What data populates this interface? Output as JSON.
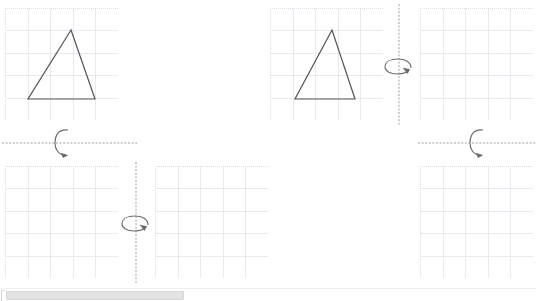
{
  "document": {
    "title": "Rotation Axis Worksheet",
    "background_color": "#ffffff",
    "width": 536,
    "height": 301
  },
  "style": {
    "grid_line_color": "#e9e9f2",
    "grid_border_color": "#dcdce8",
    "shape_stroke_color": "#555555",
    "axis_color": "#9aa0a6",
    "arrow_color": "#6b6b6b",
    "scrollbar_thumb_color": "#e3e3e3",
    "scrollbar_track_color": "#ffffff"
  },
  "panels": [
    {
      "id": "panel-top-left",
      "name": "grid-top-left",
      "x": 5,
      "y": 8,
      "width": 113,
      "height": 112,
      "cols": 5,
      "rows": 5,
      "shape": {
        "name": "triangle",
        "points": "66,22 23,91 90,91"
      }
    },
    {
      "id": "panel-top-middle",
      "name": "grid-top-middle",
      "x": 270,
      "y": 8,
      "width": 113,
      "height": 112,
      "cols": 5,
      "rows": 5,
      "shape": {
        "name": "triangle",
        "points": "62,22 25,91 85,91"
      }
    },
    {
      "id": "panel-top-right",
      "name": "grid-top-right",
      "x": 420,
      "y": 8,
      "width": 113,
      "height": 112,
      "cols": 5,
      "rows": 5,
      "shape": null
    },
    {
      "id": "panel-bottom-left",
      "name": "grid-bottom-left",
      "x": 5,
      "y": 166,
      "width": 113,
      "height": 112,
      "cols": 5,
      "rows": 5,
      "shape": null
    },
    {
      "id": "panel-bottom-middle",
      "name": "grid-bottom-middle",
      "x": 155,
      "y": 166,
      "width": 113,
      "height": 112,
      "cols": 5,
      "rows": 5,
      "shape": null
    },
    {
      "id": "panel-bottom-right",
      "name": "grid-bottom-right",
      "x": 420,
      "y": 166,
      "width": 113,
      "height": 112,
      "cols": 5,
      "rows": 5,
      "shape": null
    }
  ],
  "axes": [
    {
      "id": "axis-horizontal-left",
      "name": "rotation-axis-horizontal-left",
      "orientation": "horizontal",
      "x": 2,
      "y": 143,
      "length": 136,
      "arrow": {
        "name": "rotation-arrow-horizontal",
        "center_x": 64,
        "center_y": 143,
        "direction": "clockwise"
      }
    },
    {
      "id": "axis-horizontal-right",
      "name": "rotation-axis-horizontal-right",
      "orientation": "horizontal",
      "x": 418,
      "y": 143,
      "length": 118,
      "arrow": {
        "name": "rotation-arrow-horizontal",
        "center_x": 479,
        "center_y": 143,
        "direction": "clockwise"
      }
    },
    {
      "id": "axis-vertical-top",
      "name": "rotation-axis-vertical-top",
      "orientation": "vertical",
      "x": 399,
      "y": 4,
      "length": 122,
      "arrow": {
        "name": "rotation-arrow-vertical",
        "center_x": 399,
        "center_y": 66,
        "direction": "clockwise"
      }
    },
    {
      "id": "axis-vertical-bottom",
      "name": "rotation-axis-vertical-bottom",
      "orientation": "vertical",
      "x": 136,
      "y": 162,
      "length": 122,
      "arrow": {
        "name": "rotation-arrow-vertical",
        "center_x": 136,
        "center_y": 223,
        "direction": "clockwise"
      }
    }
  ],
  "scrollbar": {
    "name": "horizontal-scrollbar",
    "thumb_left": 6,
    "thumb_width": 178,
    "track_width": 536
  }
}
